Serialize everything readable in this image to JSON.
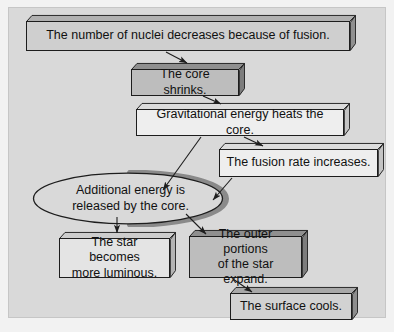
{
  "figure": {
    "background_color": "#d9d9d9",
    "outer_color": "#f2f2f2",
    "text_color": "#111111",
    "outline_color": "#1d1d1d"
  },
  "nodes": [
    {
      "id": "nuclei-decrease",
      "shape": "box-3d",
      "label": "The number of nuclei decreases because of fusion.",
      "fill": "#cfcfcf",
      "x": 26,
      "y": 15,
      "w": 330,
      "h": 36,
      "font_size": 12.5
    },
    {
      "id": "core-shrinks",
      "shape": "box-3d",
      "label": "The core shrinks.",
      "fill": "#bdbdbd",
      "x": 131,
      "y": 63,
      "w": 114,
      "h": 33,
      "font_size": 12.5
    },
    {
      "id": "gravitational-energy",
      "shape": "box-3d",
      "label": "Gravitational energy heats the core.",
      "fill": "#eeeeee",
      "x": 136,
      "y": 103,
      "w": 214,
      "h": 33,
      "font_size": 12.5
    },
    {
      "id": "fusion-rate",
      "shape": "box-3d",
      "label": "The fusion rate increases.",
      "fill": "#eeeeee",
      "x": 219,
      "y": 143,
      "w": 165,
      "h": 34,
      "font_size": 12.5
    },
    {
      "id": "additional-energy",
      "shape": "ellipse-3d",
      "label": "Additional energy is\nreleased by the core.",
      "fill": "#d9d9d9",
      "x": 32,
      "y": 170,
      "w": 197,
      "h": 57,
      "font_size": 12.5
    },
    {
      "id": "star-luminous",
      "shape": "box-3d",
      "label": "The star becomes\nmore luminous.",
      "fill": "#e4e4e4",
      "x": 59,
      "y": 232,
      "w": 117,
      "h": 46,
      "font_size": 12.5
    },
    {
      "id": "outer-portions",
      "shape": "box-3d",
      "label": "The outer portions\nof the star expand.",
      "fill": "#bdbdbd",
      "x": 189,
      "y": 230,
      "w": 119,
      "h": 48,
      "font_size": 12.5
    },
    {
      "id": "surface-cools",
      "shape": "box-3d",
      "label": "The surface cools.",
      "fill": "#d2d2d2",
      "x": 230,
      "y": 287,
      "w": 128,
      "h": 33,
      "font_size": 12.5
    }
  ],
  "arrows": [
    {
      "id": "arrow-nuclei-to-core",
      "from": "nuclei-decrease",
      "to": "core-shrinks",
      "x1": 166,
      "y1": 52,
      "x2": 186,
      "y2": 64
    },
    {
      "id": "arrow-core-to-gravity",
      "from": "core-shrinks",
      "to": "gravitational-energy",
      "x1": 203,
      "y1": 96,
      "x2": 220,
      "y2": 105
    },
    {
      "id": "arrow-gravity-to-fusion",
      "from": "gravitational-energy",
      "to": "fusion-rate",
      "x1": 243,
      "y1": 137,
      "x2": 262,
      "y2": 146
    },
    {
      "id": "arrow-gravity-to-energy",
      "from": "gravitational-energy",
      "to": "additional-energy",
      "x1": 201,
      "y1": 137,
      "x2": 162,
      "y2": 189
    },
    {
      "id": "arrow-fusion-to-energy",
      "from": "fusion-rate",
      "to": "additional-energy",
      "x1": 231,
      "y1": 178,
      "x2": 211,
      "y2": 200
    },
    {
      "id": "arrow-energy-to-luminous",
      "from": "additional-energy",
      "to": "star-luminous",
      "x1": 117,
      "y1": 218,
      "x2": 117,
      "y2": 232
    },
    {
      "id": "arrow-energy-to-outer",
      "from": "additional-energy",
      "to": "outer-portions",
      "x1": 186,
      "y1": 215,
      "x2": 205,
      "y2": 233
    },
    {
      "id": "arrow-outer-to-surface",
      "from": "outer-portions",
      "to": "surface-cools",
      "x1": 233,
      "y1": 279,
      "x2": 251,
      "y2": 291
    }
  ]
}
